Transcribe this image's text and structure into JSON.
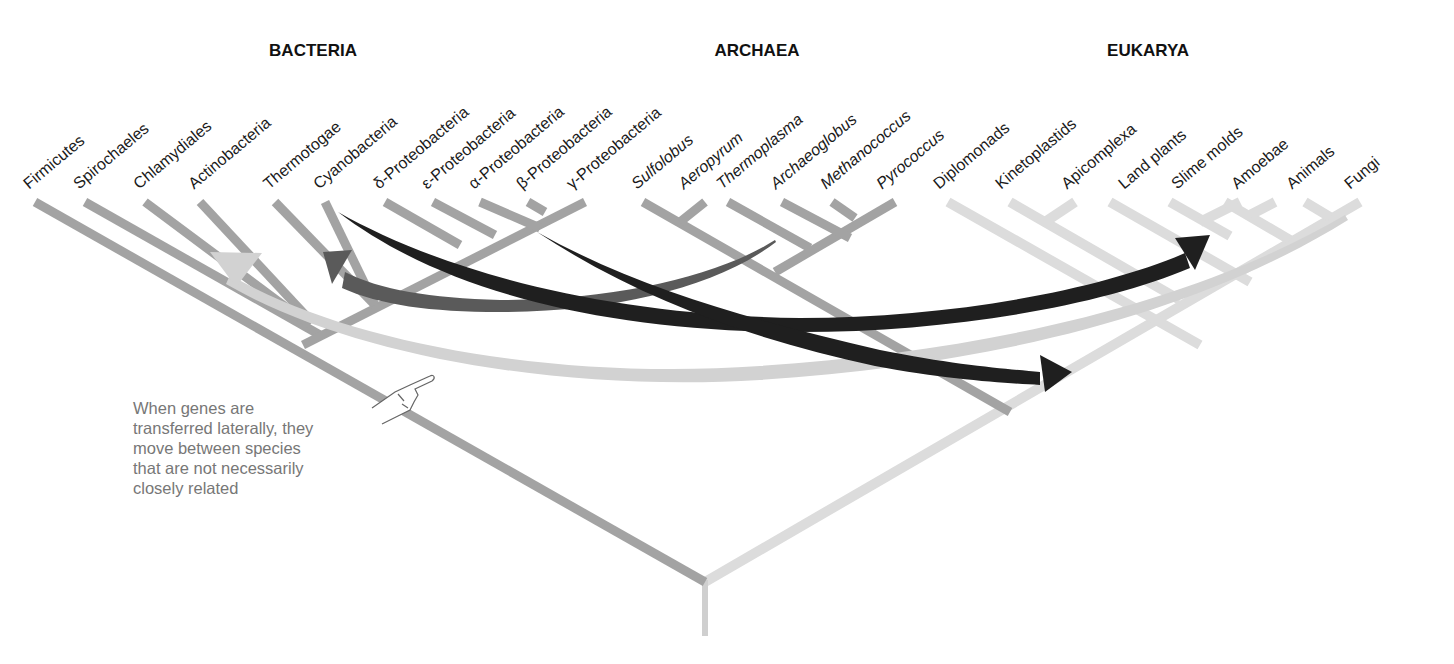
{
  "domains": [
    {
      "name": "BACTERIA",
      "x": 313
    },
    {
      "name": "ARCHAEA",
      "x": 757
    },
    {
      "name": "EUKARYA",
      "x": 1148
    }
  ],
  "taxa": [
    {
      "label": "Firmicutes",
      "domain": "Bacteria",
      "italic": false,
      "x": 35
    },
    {
      "label": "Spirochaeles",
      "domain": "Bacteria",
      "italic": false,
      "x": 85
    },
    {
      "label": "Chlamydiales",
      "domain": "Bacteria",
      "italic": false,
      "x": 145
    },
    {
      "label": "Actinobacteria",
      "domain": "Bacteria",
      "italic": false,
      "x": 200
    },
    {
      "label": "Thermotogae",
      "domain": "Bacteria",
      "italic": false,
      "x": 275
    },
    {
      "label": "Cyanobacteria",
      "domain": "Bacteria",
      "italic": false,
      "x": 325
    },
    {
      "label": "δ-Proteobacteria",
      "domain": "Bacteria",
      "italic": false,
      "x": 385
    },
    {
      "label": "ε-Proteobacteria",
      "domain": "Bacteria",
      "italic": false,
      "x": 433
    },
    {
      "label": "α-Proteobacteria",
      "domain": "Bacteria",
      "italic": false,
      "x": 480
    },
    {
      "label": "β-Proteobacteria",
      "domain": "Bacteria",
      "italic": false,
      "x": 528
    },
    {
      "label": "γ-Proteobacteria",
      "domain": "Bacteria",
      "italic": false,
      "x": 578
    },
    {
      "label": "Sulfolobus",
      "domain": "Archaea",
      "italic": true,
      "x": 643
    },
    {
      "label": "Aeropyrum",
      "domain": "Archaea",
      "italic": true,
      "x": 690
    },
    {
      "label": "Thermoplasma",
      "domain": "Archaea",
      "italic": true,
      "x": 728
    },
    {
      "label": "Archaeoglobus",
      "domain": "Archaea",
      "italic": true,
      "x": 782
    },
    {
      "label": "Methanococcus",
      "domain": "Archaea",
      "italic": true,
      "x": 832
    },
    {
      "label": "Pyrococcus",
      "domain": "Archaea",
      "italic": true,
      "x": 888
    },
    {
      "label": "Diplomonads",
      "domain": "Eukarya",
      "italic": false,
      "x": 945
    },
    {
      "label": "Kinetoplastids",
      "domain": "Eukarya",
      "italic": false,
      "x": 1007
    },
    {
      "label": "Apicomplexa",
      "domain": "Eukarya",
      "italic": false,
      "x": 1073
    },
    {
      "label": "Land plants",
      "domain": "Eukarya",
      "italic": false,
      "x": 1130
    },
    {
      "label": "Slime molds",
      "domain": "Eukarya",
      "italic": false,
      "x": 1183
    },
    {
      "label": "Amoebae",
      "domain": "Eukarya",
      "italic": false,
      "x": 1243
    },
    {
      "label": "Animals",
      "domain": "Eukarya",
      "italic": false,
      "x": 1298
    },
    {
      "label": "Fungi",
      "domain": "Eukarya",
      "italic": false,
      "x": 1356
    }
  ],
  "note": {
    "lines": [
      "When genes are",
      "transferred laterally, they",
      "move between species",
      "that are not necessarily",
      "closely related"
    ],
    "pointer_icon": "pointing-hand-icon"
  },
  "colors": {
    "bacteria_branch": "#a3a3a3",
    "archaea_branch": "#a3a3a3",
    "eukarya_branch": "#dcdcdc",
    "arrow_dark": "#1f1f1f",
    "arrow_mid": "#5a5a5a",
    "arrow_light": "#d2d2d2",
    "text": "#1a1a1a",
    "note_text": "#777777"
  },
  "transfers": [
    {
      "from": "Archaea (Archaeoglobus lineage)",
      "to": "Cyanobacteria",
      "shade": "mid"
    },
    {
      "from": "Cyanobacteria",
      "to": "Land plants / Slime molds",
      "shade": "dark"
    },
    {
      "from": "α-Proteobacteria",
      "to": "Eukarya stem",
      "shade": "dark"
    },
    {
      "from": "Animals / Fungi",
      "to": "Actinobacteria",
      "shade": "light"
    }
  ]
}
